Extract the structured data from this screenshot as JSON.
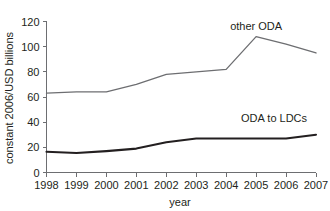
{
  "chart_data": {
    "type": "line",
    "title": "",
    "xlabel": "year",
    "ylabel": "constant 2006/USD billions",
    "x": [
      1998,
      1999,
      2000,
      2001,
      2002,
      2003,
      2004,
      2005,
      2006,
      2007
    ],
    "categories": [
      "1998",
      "1999",
      "2000",
      "2001",
      "2002",
      "2003",
      "2004",
      "2005",
      "2006",
      "2007"
    ],
    "xlim": [
      1998,
      2007
    ],
    "ylim": [
      0,
      120
    ],
    "yticks": [
      0,
      20,
      40,
      60,
      80,
      100,
      120
    ],
    "ytick_labels": [
      "0",
      "20",
      "40",
      "60",
      "80",
      "100",
      "120"
    ],
    "grid": false,
    "legend_position": "inline-annotation",
    "series": [
      {
        "name": "other ODA",
        "label": "other ODA",
        "color": "#6d6e71",
        "line_width": 1.3,
        "values": [
          63,
          64,
          64,
          70,
          78,
          80,
          82,
          108,
          102,
          95
        ]
      },
      {
        "name": "ODA to LDCs",
        "label": "ODA to LDCs",
        "color": "#231f20",
        "line_width": 2.1,
        "values": [
          16.5,
          15.5,
          17,
          19,
          24,
          27,
          27,
          27,
          27,
          30
        ]
      }
    ],
    "annotations": [
      {
        "text": "other ODA",
        "x": 2005,
        "y": 113,
        "anchor": "middle"
      },
      {
        "text": "ODA to LDCs",
        "x": 2005.6,
        "y": 40,
        "anchor": "middle"
      }
    ]
  },
  "axis": {
    "y_title": "constant 2006/USD billions",
    "x_title": "year"
  }
}
